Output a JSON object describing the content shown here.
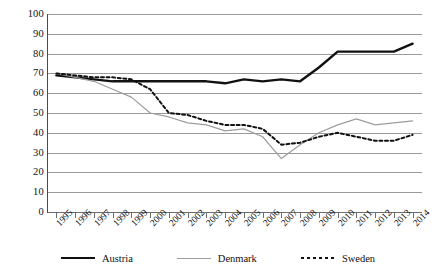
{
  "chart_data": {
    "type": "line",
    "title": "",
    "subtitle": "",
    "xlabel": "",
    "ylabel": "",
    "ylim": [
      0,
      100
    ],
    "y_ticks": [
      0,
      10,
      20,
      30,
      40,
      50,
      60,
      70,
      80,
      90,
      100
    ],
    "grid": "horizontal",
    "legend_position": "bottom",
    "categories": [
      "1995",
      "1996",
      "1997",
      "1998",
      "1999",
      "2000",
      "2001",
      "2002",
      "2003",
      "2004",
      "2005",
      "2006",
      "2007",
      "2008",
      "2009",
      "2010",
      "2011",
      "2012",
      "2013",
      "2014"
    ],
    "series": [
      {
        "name": "Austria",
        "color": "#111111",
        "style": "solid-thick",
        "values": [
          69,
          68,
          67,
          66,
          66,
          66,
          66,
          66,
          66,
          65,
          67,
          66,
          67,
          66,
          73,
          81,
          81,
          81,
          81,
          85
        ]
      },
      {
        "name": "Denmark",
        "color": "#9d9d9d",
        "style": "solid-thin",
        "values": [
          70,
          68,
          66,
          62,
          58,
          50,
          48,
          45,
          44,
          41,
          42,
          38,
          27,
          34,
          40,
          44,
          47,
          44,
          45,
          46
        ]
      },
      {
        "name": "Sweden",
        "color": "#111111",
        "style": "dotted",
        "values": [
          70,
          69,
          68,
          68,
          67,
          62,
          50,
          49,
          46,
          44,
          44,
          42,
          34,
          35,
          38,
          40,
          38,
          36,
          36,
          39
        ]
      }
    ]
  },
  "legend": {
    "items": [
      {
        "label": "Austria",
        "key": "austria"
      },
      {
        "label": "Denmark",
        "key": "denmark"
      },
      {
        "label": "Sweden",
        "key": "sweden"
      }
    ]
  },
  "axis": {
    "y_labels": [
      "100",
      "90",
      "80",
      "70",
      "60",
      "50",
      "40",
      "30",
      "20",
      "10",
      "0"
    ],
    "x_labels": [
      "1995",
      "1996",
      "1997",
      "1998",
      "1999",
      "2000",
      "2001",
      "2002",
      "2003",
      "2004",
      "2005",
      "2006",
      "2007",
      "2008",
      "2009",
      "2010",
      "2011",
      "2012",
      "2013",
      "2014"
    ]
  }
}
